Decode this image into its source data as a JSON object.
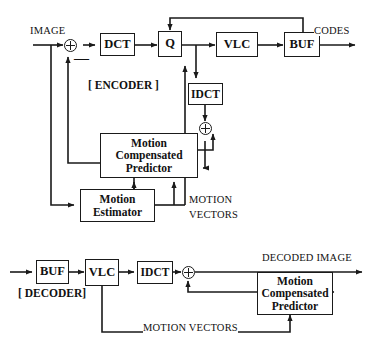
{
  "diagram": {
    "line_color": "#1a1a1a",
    "background": "#ffffff"
  },
  "encoder": {
    "section_label": "[ ENCODER ]",
    "input_label": "IMAGE",
    "output_label": "CODES",
    "minus_sign": "—",
    "motion_vectors_line1": "MOTION",
    "motion_vectors_line2": "VECTORS",
    "blocks": {
      "dct": "DCT",
      "q": "Q",
      "vlc": "VLC",
      "buf": "BUF",
      "idct": "IDCT",
      "mcp_line1": "Motion",
      "mcp_line2": "Compensated",
      "mcp_line3": "Predictor",
      "me_line1": "Motion",
      "me_line2": "Estimator"
    }
  },
  "decoder": {
    "section_label": "[ DECODER]",
    "output_label": "DECODED  IMAGE",
    "motion_vectors": "MOTION  VECTORS",
    "blocks": {
      "buf": "BUF",
      "vlc": "VLC",
      "idct": "IDCT",
      "mcp_line1": "Motion",
      "mcp_line2": "Compensated",
      "mcp_line3": "Predictor"
    }
  }
}
